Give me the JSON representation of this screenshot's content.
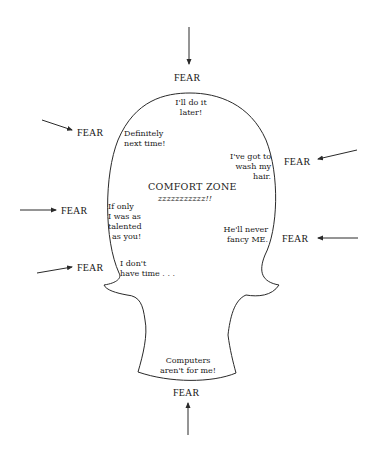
{
  "diagram": {
    "center_label": "COMFORT ZONE",
    "center_sublabel": "zzzzzzzzzzz!!",
    "fear_label": "FEAR",
    "fears": [
      {
        "id": "top",
        "label": "FEAR"
      },
      {
        "id": "upper-left",
        "label": "FEAR"
      },
      {
        "id": "upper-right",
        "label": "FEAR"
      },
      {
        "id": "mid-left",
        "label": "FEAR"
      },
      {
        "id": "mid-right",
        "label": "FEAR"
      },
      {
        "id": "lower-left",
        "label": "FEAR"
      },
      {
        "id": "bottom",
        "label": "FEAR"
      }
    ],
    "excuses": [
      {
        "id": "do-it-later",
        "lines": [
          "I'll do it",
          "later!"
        ]
      },
      {
        "id": "next-time",
        "lines": [
          "Definitely",
          "next time!"
        ]
      },
      {
        "id": "wash-hair",
        "lines": [
          "I've got to",
          "wash my",
          "hair."
        ]
      },
      {
        "id": "talented",
        "lines": [
          "If only",
          "I was as",
          "talented",
          "as you!"
        ]
      },
      {
        "id": "fancy-me",
        "lines": [
          "He'll never",
          "fancy ME."
        ]
      },
      {
        "id": "no-time",
        "lines": [
          "I don't",
          "have time . . ."
        ]
      },
      {
        "id": "computers",
        "lines": [
          "Computers",
          "aren't for me!"
        ]
      }
    ],
    "colors": {
      "line": "#2a2a2a",
      "text": "#1a1a1a",
      "background": "#ffffff"
    }
  }
}
